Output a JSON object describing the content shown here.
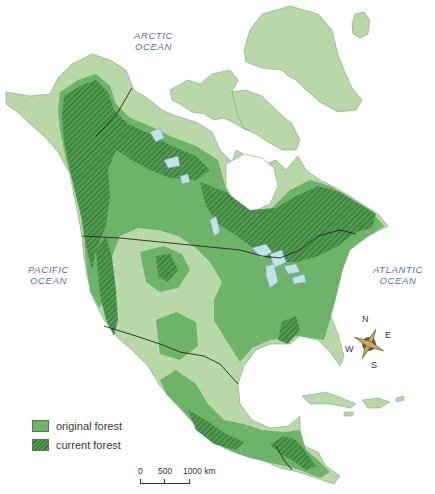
{
  "map": {
    "title": "North America forest cover",
    "colors": {
      "water": "#ffffff",
      "land": "#b9d8a8",
      "original_forest": "#6db36a",
      "current_forest": "#3f8a43",
      "hatch": "#2f6b33",
      "lakes": "#bfe0ec",
      "borders": "#1e2a1e",
      "label": "#5a6f9a"
    }
  },
  "oceans": [
    {
      "line1": "ARCTIC",
      "line2": "OCEAN"
    },
    {
      "line1": "PACIFIC",
      "line2": "OCEAN"
    },
    {
      "line1": "ATLANTIC",
      "line2": "OCEAN"
    }
  ],
  "legend": {
    "items": [
      {
        "label": "original forest",
        "color": "#6db36a",
        "pattern": "solid"
      },
      {
        "label": "current forest",
        "color": "#3f8a43",
        "pattern": "hatched"
      }
    ]
  },
  "scale": {
    "ticks": [
      "0",
      "500",
      "1000 km"
    ]
  },
  "compass": {
    "n": "N",
    "e": "E",
    "s": "S",
    "w": "W"
  }
}
